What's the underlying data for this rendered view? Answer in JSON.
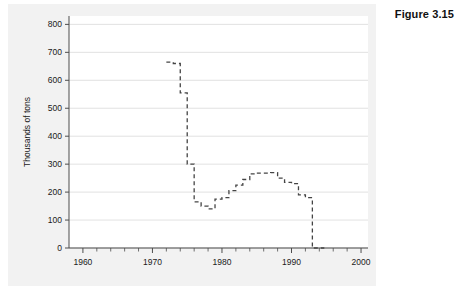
{
  "figure": {
    "label": "Figure 3.15"
  },
  "chart_data": {
    "type": "line",
    "title": "",
    "subtitle": "",
    "xlabel": "",
    "ylabel": "Thousands of tons",
    "xlim": [
      1958,
      2001
    ],
    "ylim": [
      0,
      830
    ],
    "grid": true,
    "grid_axis": "y",
    "legend": "none",
    "line_style": "dashed",
    "line_color": "#444444",
    "x_ticks": [
      1960,
      1970,
      1980,
      1990,
      2000
    ],
    "x_tick_labels": [
      "1960",
      "1970",
      "1980",
      "1990",
      "2000"
    ],
    "x_minor_ticks": [
      1962,
      1964,
      1966,
      1968,
      1972,
      1974,
      1976,
      1978,
      1982,
      1984,
      1986,
      1988,
      1992,
      1994,
      1996,
      1998
    ],
    "y_ticks": [
      0,
      100,
      200,
      300,
      400,
      500,
      600,
      700,
      800
    ],
    "y_tick_labels": [
      "0",
      "100",
      "200",
      "300",
      "400",
      "500",
      "600",
      "700",
      "800"
    ],
    "series": [
      {
        "name": "Thousands of tons",
        "x": [
          1972,
          1973,
          1974,
          1975,
          1976,
          1977,
          1978,
          1979,
          1980,
          1981,
          1982,
          1983,
          1984,
          1985,
          1986,
          1987,
          1988,
          1989,
          1990,
          1991,
          1992,
          1993,
          1994
        ],
        "values": [
          665,
          660,
          555,
          300,
          165,
          150,
          140,
          175,
          180,
          205,
          225,
          245,
          265,
          268,
          268,
          270,
          250,
          235,
          230,
          190,
          180,
          0,
          0
        ]
      }
    ]
  }
}
